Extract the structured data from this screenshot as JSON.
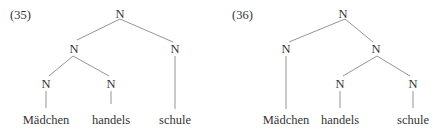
{
  "trees": [
    {
      "label": "(35)",
      "nodes": {
        "root": "N",
        "left": "N",
        "right": "N",
        "ll": "N",
        "lr": "N"
      },
      "words": [
        "Mädchen",
        "handels",
        "schule"
      ]
    },
    {
      "label": "(36)",
      "nodes": {
        "root": "N",
        "left": "N",
        "right": "N",
        "rl": "N",
        "rr": "N"
      },
      "words": [
        "Mädchen",
        "handels",
        "schule"
      ]
    }
  ],
  "colors": {
    "line": "#888888",
    "text": "#333333"
  }
}
